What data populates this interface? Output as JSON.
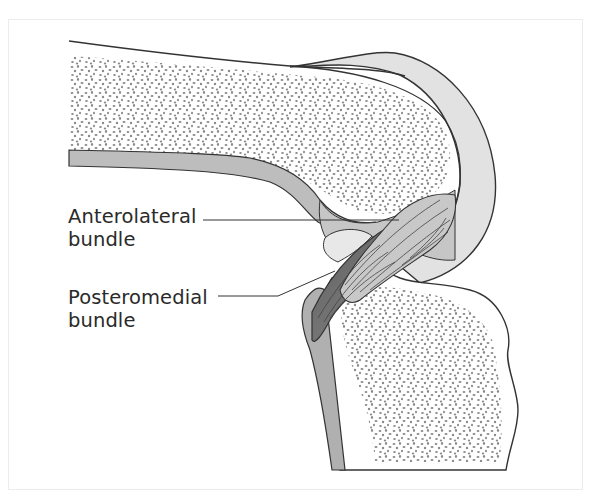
{
  "figure": {
    "labels": [
      {
        "id": "anterolateral",
        "line1": "Anterolateral",
        "line2": "bundle"
      },
      {
        "id": "posteromedial",
        "line1": "Posteromedial",
        "line2": "bundle"
      }
    ],
    "structures": [
      "femur",
      "tibia",
      "articular-cartilage",
      "anterolateral-bundle",
      "posteromedial-bundle",
      "joint-capsule"
    ],
    "colors": {
      "outline": "#333333",
      "cartilage": "#e2e2e2",
      "cortex": "#bdbdbd",
      "stipple": "#8a8a8a",
      "ligament_light": "#c8c8c8",
      "ligament_dark": "#6e6e6e",
      "label_text": "#2a2a2a"
    }
  }
}
